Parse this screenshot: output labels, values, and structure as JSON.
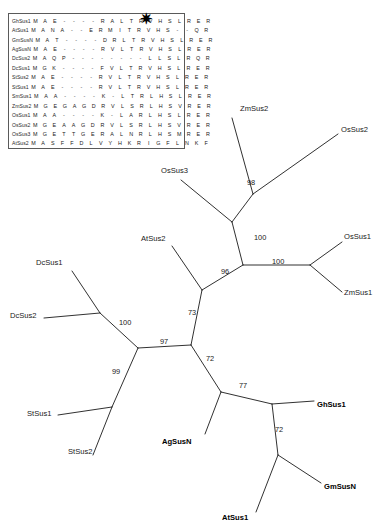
{
  "figure": {
    "alignment": {
      "marker": "✷",
      "marker_column_index": 13,
      "columns": 17,
      "rows": [
        {
          "name": "GhSus1",
          "residues": [
            "M",
            "A",
            "E",
            "-",
            "-",
            "-",
            "-",
            "R",
            "A",
            "L",
            "T",
            "R",
            "V",
            "H",
            "S",
            "L",
            "R",
            "E",
            "R"
          ]
        },
        {
          "name": "AtSus1",
          "residues": [
            "M",
            "A",
            "N",
            "A",
            "-",
            "-",
            "E",
            "R",
            "M",
            "I",
            "T",
            "R",
            "V",
            "H",
            "S",
            "-",
            "-",
            "Q",
            "R"
          ]
        },
        {
          "name": "GmSusN",
          "residues": [
            "M",
            "A",
            "T",
            "-",
            "-",
            "-",
            "-",
            "D",
            "R",
            "L",
            "T",
            "R",
            "V",
            "H",
            "S",
            "L",
            "R",
            "E",
            "R"
          ]
        },
        {
          "name": "AgSusN",
          "residues": [
            "M",
            "A",
            "E",
            "-",
            "-",
            "-",
            "-",
            "R",
            "V",
            "L",
            "T",
            "R",
            "V",
            "H",
            "S",
            "L",
            "R",
            "E",
            "R"
          ]
        },
        {
          "name": "DcSus2",
          "residues": [
            "M",
            "A",
            "Q",
            "P",
            "-",
            "-",
            "-",
            "-",
            "-",
            "-",
            "-",
            "-",
            "L",
            "L",
            "S",
            "L",
            "R",
            "Q",
            "R"
          ]
        },
        {
          "name": "DcSus1",
          "residues": [
            "M",
            "G",
            "K",
            "-",
            "-",
            "-",
            "-",
            "F",
            "V",
            "L",
            "T",
            "R",
            "V",
            "H",
            "S",
            "L",
            "R",
            "E",
            "R"
          ]
        },
        {
          "name": "StSus2",
          "residues": [
            "M",
            "A",
            "E",
            "-",
            "-",
            "-",
            "-",
            "R",
            "V",
            "L",
            "T",
            "R",
            "V",
            "H",
            "S",
            "L",
            "R",
            "E",
            "R"
          ]
        },
        {
          "name": "StSus1",
          "residues": [
            "M",
            "A",
            "E",
            "-",
            "-",
            "-",
            "-",
            "R",
            "V",
            "L",
            "T",
            "R",
            "V",
            "H",
            "S",
            "L",
            "R",
            "E",
            "R"
          ]
        },
        {
          "name": "SmSus1",
          "residues": [
            "M",
            "A",
            "A",
            "-",
            "-",
            "-",
            "-",
            "K",
            "-",
            "L",
            "T",
            "R",
            "L",
            "H",
            "S",
            "L",
            "R",
            "E",
            "R"
          ]
        },
        {
          "name": "ZmSus2",
          "residues": [
            "M",
            "G",
            "E",
            "G",
            "A",
            "G",
            "D",
            "R",
            "V",
            "L",
            "S",
            "R",
            "L",
            "H",
            "S",
            "V",
            "R",
            "E",
            "R"
          ]
        },
        {
          "name": "OsSus1",
          "residues": [
            "M",
            "A",
            "A",
            "-",
            "-",
            "-",
            "-",
            "K",
            "-",
            "L",
            "A",
            "R",
            "L",
            "H",
            "S",
            "L",
            "R",
            "E",
            "R"
          ]
        },
        {
          "name": "OsSus2",
          "residues": [
            "M",
            "G",
            "E",
            "A",
            "A",
            "G",
            "D",
            "R",
            "V",
            "L",
            "S",
            "R",
            "L",
            "H",
            "S",
            "V",
            "R",
            "E",
            "R"
          ]
        },
        {
          "name": "OsSus3",
          "residues": [
            "M",
            "G",
            "E",
            "T",
            "T",
            "G",
            "E",
            "R",
            "A",
            "L",
            "N",
            "R",
            "L",
            "H",
            "S",
            "M",
            "R",
            "E",
            "R"
          ]
        },
        {
          "name": "AtSus2",
          "residues": [
            "M",
            "A",
            "S",
            "F",
            "F",
            "D",
            "L",
            "V",
            "Y",
            "H",
            "K",
            "R",
            "I",
            "G",
            "F",
            "L",
            "N",
            "K",
            "F"
          ]
        }
      ]
    },
    "tree": {
      "type": "unrooted-phylogram",
      "taxa": [
        {
          "name": "ZmSus2",
          "x": 240,
          "y": 109,
          "bold": false,
          "anchor": "start"
        },
        {
          "name": "OsSus2",
          "x": 341,
          "y": 130,
          "bold": false,
          "anchor": "start"
        },
        {
          "name": "OsSus3",
          "x": 161,
          "y": 171,
          "bold": false,
          "anchor": "start"
        },
        {
          "name": "OsSus1",
          "x": 344,
          "y": 237,
          "bold": false,
          "anchor": "start"
        },
        {
          "name": "AtSus2",
          "x": 141,
          "y": 239,
          "bold": false,
          "anchor": "start"
        },
        {
          "name": "ZmSus1",
          "x": 344,
          "y": 293,
          "bold": false,
          "anchor": "start"
        },
        {
          "name": "DcSus1",
          "x": 36,
          "y": 263,
          "bold": false,
          "anchor": "start"
        },
        {
          "name": "DcSus2",
          "x": 10,
          "y": 316,
          "bold": false,
          "anchor": "start"
        },
        {
          "name": "StSus1",
          "x": 27,
          "y": 414,
          "bold": false,
          "anchor": "start"
        },
        {
          "name": "StSus2",
          "x": 68,
          "y": 452,
          "bold": false,
          "anchor": "start"
        },
        {
          "name": "AgSusN",
          "x": 162,
          "y": 442,
          "bold": true,
          "anchor": "start"
        },
        {
          "name": "GhSus1",
          "x": 317,
          "y": 405,
          "bold": true,
          "anchor": "start"
        },
        {
          "name": "GmSusN",
          "x": 324,
          "y": 487,
          "bold": true,
          "anchor": "start"
        },
        {
          "name": "AtSus1",
          "x": 222,
          "y": 518,
          "bold": true,
          "anchor": "start"
        }
      ],
      "bootstrap": [
        {
          "value": "98",
          "x": 247,
          "y": 183
        },
        {
          "value": "100",
          "x": 254,
          "y": 238
        },
        {
          "value": "100",
          "x": 272,
          "y": 262
        },
        {
          "value": "96",
          "x": 221,
          "y": 272
        },
        {
          "value": "73",
          "x": 188,
          "y": 313
        },
        {
          "value": "100",
          "x": 119,
          "y": 323
        },
        {
          "value": "97",
          "x": 160,
          "y": 342
        },
        {
          "value": "99",
          "x": 112,
          "y": 372
        },
        {
          "value": "72",
          "x": 206,
          "y": 359
        },
        {
          "value": "77",
          "x": 239,
          "y": 386
        },
        {
          "value": "72",
          "x": 275,
          "y": 430
        }
      ],
      "edges": [
        {
          "x1": 232,
          "y1": 118,
          "x2": 253,
          "y2": 194,
          "name": "edge-zmsus2"
        },
        {
          "x1": 253,
          "y1": 194,
          "x2": 338,
          "y2": 134,
          "name": "edge-ossus2"
        },
        {
          "x1": 253,
          "y1": 194,
          "x2": 232,
          "y2": 222,
          "name": "edge-node98"
        },
        {
          "x1": 232,
          "y1": 222,
          "x2": 181,
          "y2": 180,
          "name": "edge-ossus3"
        },
        {
          "x1": 232,
          "y1": 222,
          "x2": 243,
          "y2": 265,
          "name": "edge-node100a"
        },
        {
          "x1": 243,
          "y1": 265,
          "x2": 310,
          "y2": 265,
          "name": "edge-node100b"
        },
        {
          "x1": 310,
          "y1": 265,
          "x2": 342,
          "y2": 242,
          "name": "edge-ossus1"
        },
        {
          "x1": 310,
          "y1": 265,
          "x2": 342,
          "y2": 292,
          "name": "edge-zmsus1"
        },
        {
          "x1": 243,
          "y1": 265,
          "x2": 202,
          "y2": 290,
          "name": "edge-node96"
        },
        {
          "x1": 202,
          "y1": 290,
          "x2": 172,
          "y2": 246,
          "name": "edge-atsus2"
        },
        {
          "x1": 202,
          "y1": 290,
          "x2": 191,
          "y2": 345,
          "name": "edge-node73"
        },
        {
          "x1": 191,
          "y1": 345,
          "x2": 138,
          "y2": 348,
          "name": "edge-node97"
        },
        {
          "x1": 138,
          "y1": 348,
          "x2": 100,
          "y2": 313,
          "name": "edge-node100c"
        },
        {
          "x1": 100,
          "y1": 313,
          "x2": 72,
          "y2": 271,
          "name": "edge-dcsus1"
        },
        {
          "x1": 100,
          "y1": 313,
          "x2": 44,
          "y2": 318,
          "name": "edge-dcsus2"
        },
        {
          "x1": 138,
          "y1": 348,
          "x2": 112,
          "y2": 407,
          "name": "edge-node99"
        },
        {
          "x1": 112,
          "y1": 407,
          "x2": 58,
          "y2": 415,
          "name": "edge-stsus1"
        },
        {
          "x1": 112,
          "y1": 407,
          "x2": 93,
          "y2": 455,
          "name": "edge-stsus2"
        },
        {
          "x1": 191,
          "y1": 345,
          "x2": 221,
          "y2": 392,
          "name": "edge-node72a"
        },
        {
          "x1": 221,
          "y1": 392,
          "x2": 205,
          "y2": 434,
          "name": "edge-agsusn"
        },
        {
          "x1": 221,
          "y1": 392,
          "x2": 272,
          "y2": 404,
          "name": "edge-node77"
        },
        {
          "x1": 272,
          "y1": 404,
          "x2": 314,
          "y2": 401,
          "name": "edge-ghsus1"
        },
        {
          "x1": 272,
          "y1": 404,
          "x2": 278,
          "y2": 455,
          "name": "edge-node72b"
        },
        {
          "x1": 278,
          "y1": 455,
          "x2": 321,
          "y2": 483,
          "name": "edge-gmsusn"
        },
        {
          "x1": 278,
          "y1": 455,
          "x2": 256,
          "y2": 512,
          "name": "edge-atsus1"
        }
      ]
    }
  }
}
